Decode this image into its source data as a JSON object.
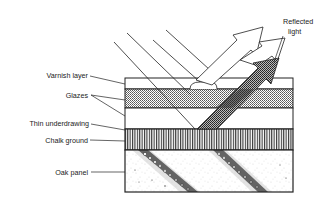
{
  "diagram": {
    "labels": {
      "reflected_light": [
        "Reflected",
        "light"
      ],
      "varnish": "Varnish layer",
      "glazes": "Glazes",
      "underdrawing": "Thin underdrawing",
      "chalk": "Chalk ground",
      "oak": "Oak panel"
    },
    "layers": [
      {
        "name": "Varnish layer",
        "pattern": "blank"
      },
      {
        "name": "Glazes",
        "pattern": "dotted"
      },
      {
        "name": "Thin underdrawing",
        "pattern": "blank"
      },
      {
        "name": "Chalk ground",
        "pattern": "vertical-lines"
      },
      {
        "name": "Oak panel",
        "pattern": "stippled-grain"
      }
    ],
    "colors": {
      "ink": "#222222",
      "background": "#ffffff"
    }
  }
}
